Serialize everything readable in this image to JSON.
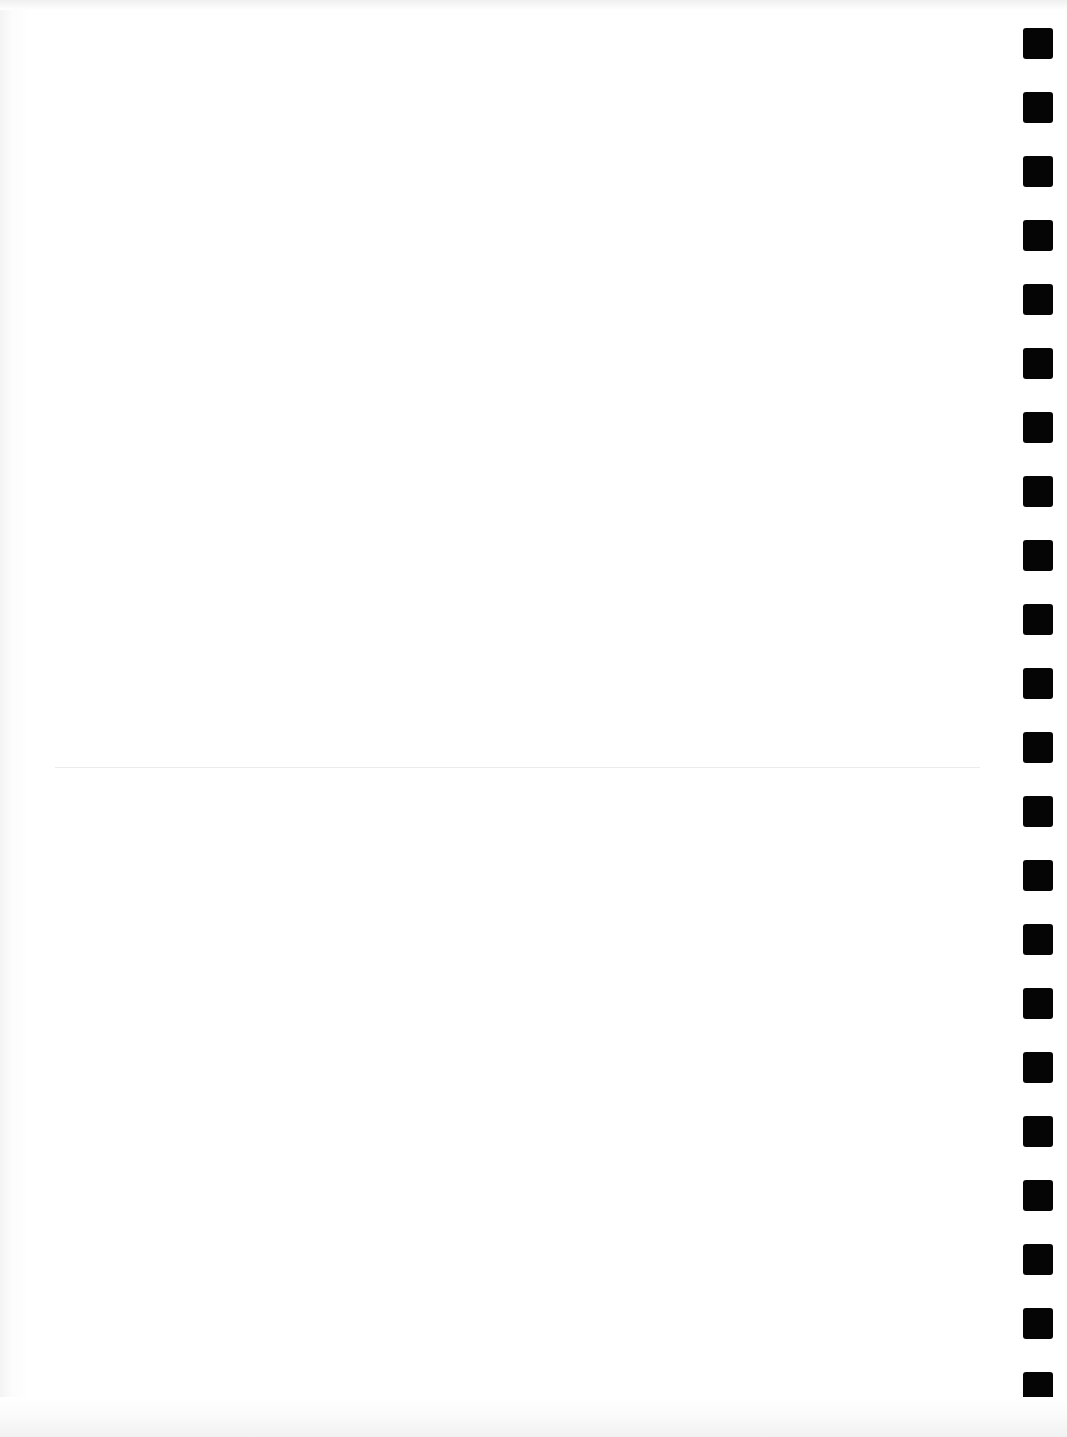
{
  "page": {
    "background_color": "#ffffff",
    "content_text": ""
  },
  "fold_line": {
    "color": "#ececec",
    "y": 767
  },
  "registration_marks": {
    "count": 22,
    "color": "#050505",
    "first_y": 28,
    "pitch": 64,
    "size": 30
  }
}
